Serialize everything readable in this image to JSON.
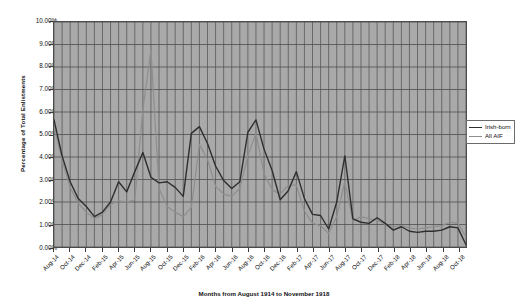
{
  "chart_data": {
    "type": "line",
    "title": "",
    "subtitle": "",
    "xlabel": "Months from August 1914 to November 1918",
    "ylabel": "Percentage of Total Enlistments",
    "ylim": [
      0,
      10
    ],
    "ytick_step": 1,
    "ytick_labels": [
      "10.00%",
      "9.00%",
      "8.00%",
      "7.00%",
      "6.00%",
      "5.00%",
      "4.00%",
      "3.00%",
      "2.00%",
      "1.00%",
      "0.00%"
    ],
    "ytick_values": [
      10,
      9,
      8,
      7,
      6,
      5,
      4,
      3,
      2,
      1,
      0
    ],
    "grid": true,
    "grid_x": "every month",
    "grid_y": "every 1.00%",
    "legend_position": "right",
    "plot_background": "#a9a9a9",
    "categories": [
      "Aug-14",
      "Sep-14",
      "Oct-14",
      "Nov-14",
      "Dec-14",
      "Jan-15",
      "Feb-15",
      "Mar-15",
      "Apr-15",
      "May-15",
      "Jun-15",
      "Jul-15",
      "Aug-15",
      "Sep-15",
      "Oct-15",
      "Nov-15",
      "Dec-15",
      "Jan-16",
      "Feb-16",
      "Mar-16",
      "Apr-16",
      "May-16",
      "Jun-16",
      "Jul-16",
      "Aug-16",
      "Sep-16",
      "Oct-16",
      "Nov-16",
      "Dec-16",
      "Jan-17",
      "Feb-17",
      "Mar-17",
      "Apr-17",
      "May-17",
      "Jun-17",
      "Jul-17",
      "Aug-17",
      "Sep-17",
      "Oct-17",
      "Nov-17",
      "Dec-17",
      "Jan-18",
      "Feb-18",
      "Mar-18",
      "Apr-18",
      "May-18",
      "Jun-18",
      "Jul-18",
      "Aug-18",
      "Sep-18",
      "Oct-18",
      "Nov-18"
    ],
    "xtick_labels": [
      "Aug-14",
      "Oct-14",
      "Dec-14",
      "Feb-15",
      "Apr-15",
      "Jun-15",
      "Aug-15",
      "Oct-15",
      "Dec-15",
      "Feb-16",
      "Apr-16",
      "Jun-16",
      "Aug-16",
      "Oct-16",
      "Dec-16",
      "Feb-17",
      "Apr-17",
      "Jun-17",
      "Aug-17",
      "Oct-17",
      "Dec-17",
      "Feb-18",
      "Apr-18",
      "Jun-18",
      "Aug-18",
      "Oct-18"
    ],
    "xtick_indices": [
      0,
      2,
      4,
      6,
      8,
      10,
      12,
      14,
      16,
      18,
      20,
      22,
      24,
      26,
      28,
      30,
      32,
      34,
      36,
      38,
      40,
      42,
      44,
      46,
      48,
      50
    ],
    "series": [
      {
        "name": "Irish-born",
        "color": "#2e2e2e",
        "width": 1.4,
        "values": [
          5.65,
          4.05,
          2.9,
          2.15,
          1.8,
          1.35,
          1.55,
          2.0,
          2.9,
          2.45,
          3.35,
          4.2,
          3.1,
          2.85,
          2.9,
          2.65,
          2.25,
          5.05,
          5.35,
          4.6,
          3.6,
          2.95,
          2.6,
          2.9,
          5.1,
          5.65,
          4.35,
          3.4,
          2.1,
          2.5,
          3.35,
          2.15,
          1.45,
          1.4,
          0.8,
          2.0,
          4.05,
          1.25,
          1.1,
          1.05,
          1.3,
          1.05,
          0.75,
          0.9,
          0.7,
          0.65,
          0.7,
          0.7,
          0.75,
          0.9,
          0.85,
          0.1
        ]
      },
      {
        "name": "All AIF",
        "color": "#8e8e8e",
        "width": 1.2,
        "values": [
          5.4,
          3.85,
          2.65,
          1.95,
          1.55,
          1.25,
          1.45,
          1.9,
          2.05,
          2.0,
          2.1,
          6.1,
          8.75,
          2.6,
          1.8,
          1.55,
          1.35,
          1.75,
          4.55,
          3.9,
          2.7,
          2.35,
          2.25,
          2.6,
          4.05,
          5.05,
          3.25,
          2.55,
          2.35,
          2.75,
          2.75,
          1.6,
          1.05,
          0.95,
          0.6,
          1.35,
          2.9,
          1.15,
          1.35,
          1.25,
          1.2,
          1.0,
          0.9,
          0.95,
          0.85,
          0.8,
          0.85,
          0.9,
          0.95,
          1.1,
          1.05,
          0.45
        ]
      }
    ]
  },
  "legend": {
    "items": [
      {
        "label": "Irish-born"
      },
      {
        "label": "All AIF"
      }
    ]
  }
}
